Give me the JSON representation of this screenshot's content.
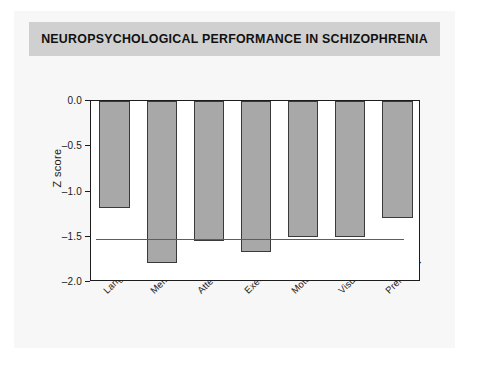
{
  "figure": {
    "title": "NEUROPSYCHOLOGICAL PERFORMANCE IN SCHIZOPHRENIA",
    "banner_color": "#d0d0d0",
    "card_color": "#f7f7f7",
    "bar_fill_color": "#a8a8a8",
    "bar_edge_color": "#3a3a3a",
    "axis_color": "#1c1c1c"
  },
  "chart_data": {
    "type": "bar",
    "title": "NEUROPSYCHOLOGICAL PERFORMANCE IN SCHIZOPHRENIA",
    "xlabel": "",
    "ylabel": "Z score",
    "categories": [
      "Language",
      "Memory",
      "Attention",
      "Executive",
      "Motor",
      "Visuospatial",
      "Premorbid"
    ],
    "values": [
      -1.18,
      -1.79,
      -1.55,
      -1.67,
      -1.5,
      -1.5,
      -1.29
    ],
    "ylim": [
      -2.0,
      0.0
    ],
    "yticks": [
      0.0,
      -0.5,
      -1.0,
      -1.5,
      -2.0
    ],
    "ytick_labels": [
      "0.0",
      "–0.5",
      "–1.0",
      "–1.5",
      "–2.0"
    ],
    "grid": false,
    "legend": null,
    "reference_line": {
      "value": -1.53,
      "label": "",
      "color": "#5d5d5d"
    },
    "orientation": "vertical",
    "bars_direction": "downward"
  }
}
